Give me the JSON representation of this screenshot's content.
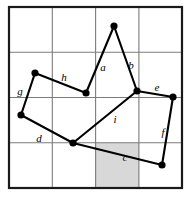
{
  "figure": {
    "canvas": {
      "width": 192,
      "height": 197
    },
    "colors": {
      "background": "#ffffff",
      "outer_border": "#1a1a1a",
      "grid_line": "#7b7b7b",
      "polygon_stroke": "#000000",
      "vertex_fill": "#000000",
      "shaded_cell": "#d8d8d8",
      "label_text": "#000000"
    },
    "grid": {
      "columns": 4,
      "rows": 4,
      "x_lines": [
        9,
        52.3,
        95.6,
        138.9,
        182
      ],
      "y_lines": [
        7,
        52.3,
        97.5,
        142.8,
        188
      ],
      "outer_border_width": 2.2,
      "inner_line_width": 1.1
    },
    "shaded_cell": {
      "label": "shaded-cell",
      "column": 3,
      "row": 4,
      "x": 95.6,
      "y": 142.8,
      "width": 43.3,
      "height": 45.2
    },
    "vertices": [
      {
        "id": "v1",
        "name": "apex",
        "x": 114,
        "y": 26
      },
      {
        "id": "v2",
        "name": "right-junction",
        "x": 137,
        "y": 91
      },
      {
        "id": "v3",
        "name": "east",
        "x": 173,
        "y": 97
      },
      {
        "id": "v4",
        "name": "south-east",
        "x": 162,
        "y": 165
      },
      {
        "id": "v5",
        "name": "south-center",
        "x": 73,
        "y": 143
      },
      {
        "id": "v6",
        "name": "west",
        "x": 21,
        "y": 115
      },
      {
        "id": "v7",
        "name": "north-west",
        "x": 35,
        "y": 73
      },
      {
        "id": "v8",
        "name": "mid-left",
        "x": 86,
        "y": 93
      }
    ],
    "vertex_radius": 3.6,
    "edges": [
      {
        "id": "e_a",
        "label": "a",
        "from": "v8",
        "to": "v1",
        "label_x": 103,
        "label_y": 68
      },
      {
        "id": "e_b",
        "label": "b",
        "from": "v1",
        "to": "v2",
        "label_x": 131,
        "label_y": 66
      },
      {
        "id": "e_e",
        "label": "e",
        "from": "v2",
        "to": "v3",
        "label_x": 157,
        "label_y": 88
      },
      {
        "id": "e_f",
        "label": "f",
        "from": "v3",
        "to": "v4",
        "label_x": 163,
        "label_y": 133
      },
      {
        "id": "e_c",
        "label": "c",
        "from": "v4",
        "to": "v5",
        "label_x": 125,
        "label_y": 158
      },
      {
        "id": "e_i",
        "label": "i",
        "from": "v5",
        "to": "v2",
        "label_x": 115,
        "label_y": 120
      },
      {
        "id": "e_d",
        "label": "d",
        "from": "v5",
        "to": "v6",
        "label_x": 39,
        "label_y": 139
      },
      {
        "id": "e_g",
        "label": "g",
        "from": "v6",
        "to": "v7",
        "label_x": 20,
        "label_y": 92
      },
      {
        "id": "e_h",
        "label": "h",
        "from": "v7",
        "to": "v8",
        "label_x": 64,
        "label_y": 78
      }
    ],
    "polygon_stroke_width": 2.1
  }
}
